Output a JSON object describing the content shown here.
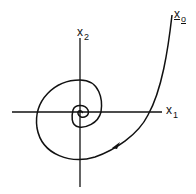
{
  "figure": {
    "type": "phase-portrait-spiral",
    "axes": {
      "horizontal": {
        "name": "x",
        "subscript": "1"
      },
      "vertical": {
        "name": "x",
        "subscript": "2"
      }
    },
    "initial_state": {
      "name": "x",
      "subscript": "o",
      "underlined": true
    },
    "colors": {
      "stroke": "#111111",
      "background": "#ffffff"
    }
  }
}
